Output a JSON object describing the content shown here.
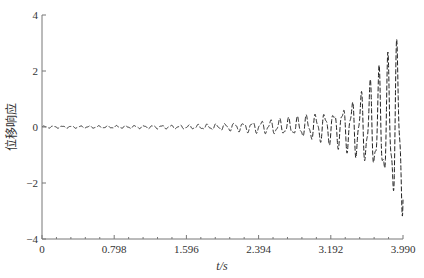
{
  "chart_data": {
    "type": "line",
    "title": "",
    "xlabel": "t/s",
    "ylabel": "位移响应",
    "xlim": [
      0,
      3.99
    ],
    "ylim": [
      -4,
      4
    ],
    "x_ticks": [
      "0",
      "0.798",
      "1.596",
      "2.394",
      "3.192",
      "3.990"
    ],
    "y_ticks": [
      "4",
      "2",
      "0",
      "−2",
      "−4"
    ],
    "grid": false,
    "legend": null,
    "series": [
      {
        "name": "displacement response",
        "style": "dashed",
        "description": "Oscillating response with growing amplitude envelope (unstable/flutter-like divergence)",
        "envelope": {
          "t": [
            0,
            0.8,
            1.6,
            2.0,
            2.4,
            2.8,
            3.2,
            3.4,
            3.6,
            3.8,
            3.99
          ],
          "amplitude": [
            0.03,
            0.04,
            0.06,
            0.1,
            0.18,
            0.28,
            0.5,
            0.75,
            1.2,
            1.9,
            2.8
          ]
        },
        "frequency_hz": 10
      }
    ]
  }
}
